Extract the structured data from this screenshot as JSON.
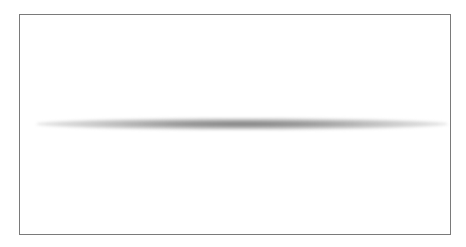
{
  "canvas": {
    "background_color": "#ffffff",
    "frame": {
      "border_color": "#7a7a7a"
    },
    "streak": {
      "shape": "blurred-horizontal-ellipse",
      "color": "#888888"
    }
  }
}
